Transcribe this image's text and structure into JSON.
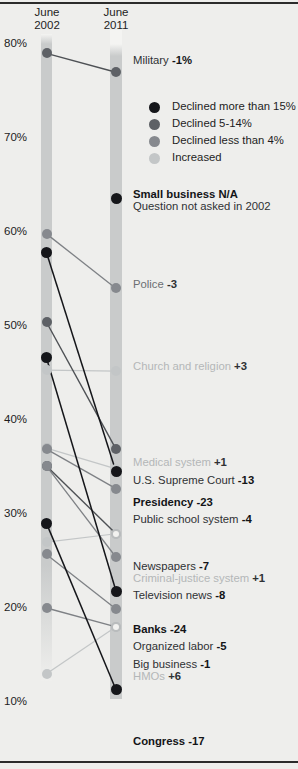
{
  "header": {
    "left_col": {
      "month": "June",
      "year": "2002"
    },
    "right_col": {
      "month": "June",
      "year": "2011"
    }
  },
  "axis": {
    "ticks": [
      "80%",
      "70%",
      "60%",
      "50%",
      "40%",
      "30%",
      "20%",
      "10%"
    ]
  },
  "legend": {
    "items": [
      {
        "label": "Declined more than 15%",
        "color": "#15161a",
        "key": "black"
      },
      {
        "label": "Declined 5-14%",
        "color": "#5e6166",
        "key": "dark"
      },
      {
        "label": "Declined less than 4%",
        "color": "#86898e",
        "key": "mid"
      },
      {
        "label": "Increased",
        "color": "#c3c6c7",
        "key": "light"
      }
    ]
  },
  "chart_data": {
    "type": "line",
    "xlabel": "",
    "ylabel": "Percent with a great deal / quite a lot of confidence",
    "ylim": [
      10,
      80
    ],
    "x": [
      "June 2002",
      "June 2011"
    ],
    "grid": false,
    "legend_position": "upper-right",
    "series": [
      {
        "name": "Military",
        "label": "Military",
        "delta": "-1%",
        "v2002": 79,
        "v2011": 77,
        "style": "dark"
      },
      {
        "name": "Small business",
        "label": "Small business",
        "delta": "N/A",
        "sub": "Question not asked in 2002",
        "v2002": null,
        "v2011": 63.6,
        "style": "black"
      },
      {
        "name": "Police",
        "label": "Police",
        "delta": "-3",
        "v2002": 59.8,
        "v2011": 54,
        "style": "mid"
      },
      {
        "name": "Church and religion",
        "label": "Church and religion",
        "delta": "+3",
        "v2002": 45.3,
        "v2011": 45.2,
        "style": "light"
      },
      {
        "name": "Medical system",
        "label": "Medical system",
        "delta": "+1",
        "v2002": 37.0,
        "v2011": 34.8,
        "style": "light"
      },
      {
        "name": "U.S. Supreme Court",
        "label": "U.S. Supreme Court",
        "delta": "-13",
        "v2002": 50.4,
        "v2011": 36.9,
        "style": "dark"
      },
      {
        "name": "Presidency",
        "label": "Presidency",
        "delta": "-23",
        "v2002": 57.8,
        "v2011": 34.5,
        "style": "black"
      },
      {
        "name": "Public school system",
        "label": "Public school system",
        "delta": "-4",
        "v2002": 36.9,
        "v2011": 32.7,
        "style": "mid"
      },
      {
        "name": "Newspapers",
        "label": "Newspapers",
        "delta": "-7",
        "v2002": 35.1,
        "v2011": 27.9,
        "style": "dark"
      },
      {
        "name": "Criminal-justice system",
        "label": "Criminal-justice system",
        "delta": "+1",
        "v2002": 27.0,
        "v2011": 27.9,
        "style": "light"
      },
      {
        "name": "Television news",
        "label": "Television news",
        "delta": "-8",
        "v2002": 35.1,
        "v2011": 25.4,
        "style": "mid"
      },
      {
        "name": "Banks",
        "label": "Banks",
        "delta": "-24",
        "v2002": 46.6,
        "v2011": 21.8,
        "style": "black"
      },
      {
        "name": "Organized labor",
        "label": "Organized labor",
        "delta": "-5",
        "v2002": 25.7,
        "v2011": 19.9,
        "style": "mid"
      },
      {
        "name": "Big business",
        "label": "Big business",
        "delta": "-1",
        "v2002": 20.0,
        "v2011": 18.0,
        "style": "mid"
      },
      {
        "name": "HMOs",
        "label": "HMOs",
        "delta": "+6",
        "v2002": 13.0,
        "v2011": 18.0,
        "style": "light"
      },
      {
        "name": "Congress",
        "label": "Congress",
        "delta": "-17",
        "v2002": 29.0,
        "v2011": 11.3,
        "style": "black"
      }
    ]
  },
  "labels": [
    {
      "text": "Military",
      "delta": "-1%",
      "style": "dark",
      "top": 55,
      "left": 133
    },
    {
      "text": "Small business",
      "delta": "N/A",
      "sub": "Question not asked in 2002",
      "style": "black",
      "top": 189,
      "left": 133
    },
    {
      "text": "Police",
      "delta": "-3",
      "style": "mid",
      "top": 279,
      "left": 133
    },
    {
      "text": "Church and religion",
      "delta": "+3",
      "style": "light",
      "top": 361,
      "left": 133
    },
    {
      "text": "Medical system",
      "delta": "+1",
      "style": "light",
      "top": 457,
      "left": 133
    },
    {
      "text": "U.S. Supreme Court",
      "delta": "-13",
      "style": "dark",
      "top": 475,
      "left": 133
    },
    {
      "text": "Presidency",
      "delta": "-23",
      "style": "black",
      "top": 497,
      "left": 133
    },
    {
      "text": "Public school system",
      "delta": "-4",
      "style": "dark",
      "top": 514,
      "left": 133
    },
    {
      "text": "Newspapers",
      "delta": "-7",
      "style": "dark",
      "top": 561,
      "left": 133
    },
    {
      "text": "Criminal-justice system",
      "delta": "+1",
      "style": "light",
      "top": 573,
      "left": 133
    },
    {
      "text": "Television news",
      "delta": "-8",
      "style": "dark",
      "top": 590,
      "left": 133
    },
    {
      "text": "Banks",
      "delta": "-24",
      "style": "black",
      "top": 624,
      "left": 133
    },
    {
      "text": "Organized labor",
      "delta": "-5",
      "style": "dark",
      "top": 641,
      "left": 133
    },
    {
      "text": "Big business",
      "delta": "-1",
      "style": "dark",
      "top": 659,
      "left": 133
    },
    {
      "text": "HMOs",
      "delta": "+6",
      "style": "light",
      "top": 671,
      "left": 133
    },
    {
      "text": "Congress",
      "delta": "-17",
      "style": "black",
      "top": 736,
      "left": 133
    }
  ]
}
